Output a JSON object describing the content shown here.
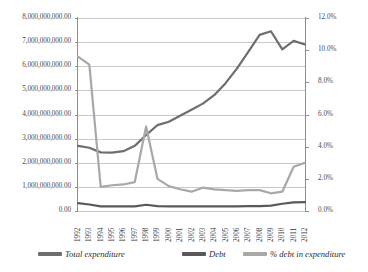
{
  "chart_data": {
    "type": "line",
    "title": "",
    "xlabel": "",
    "ylabel": "",
    "grid": true,
    "legend_position": "bottom",
    "categories": [
      "1992",
      "1993",
      "1994",
      "1995",
      "1996",
      "1997",
      "1998",
      "1999",
      "2000",
      "2001",
      "2002",
      "2003",
      "2004",
      "2005",
      "2006",
      "2007",
      "2008",
      "2009",
      "2010",
      "2011",
      "2012"
    ],
    "left_axis": {
      "ylim": [
        0,
        8000000000
      ],
      "tick_labels": [
        "8,000,000,000.00",
        "7,000,000,000.00",
        "6,000,000,000.00",
        "5,000,000,000.00",
        "4,000,000,000.00",
        "3,000,000,000.00",
        "2,000,000,000.00",
        "1,000,000,000.00",
        "0.00"
      ],
      "tick_values": [
        8000000000,
        7000000000,
        6000000000,
        5000000000,
        4000000000,
        3000000000,
        2000000000,
        1000000000,
        0
      ]
    },
    "right_axis": {
      "ylim": [
        0,
        12
      ],
      "tick_labels": [
        "12.0%",
        "10.0%",
        "8.0%",
        "6.0%",
        "4.0%",
        "2.0%",
        "0.0%"
      ],
      "tick_values": [
        12,
        10,
        8,
        6,
        4,
        2,
        0
      ]
    },
    "series": [
      {
        "name": "Total expenditure",
        "axis": "left",
        "color": "#6e6e6e",
        "values": [
          2700000000,
          2620000000,
          2430000000,
          2420000000,
          2480000000,
          2700000000,
          3150000000,
          3560000000,
          3700000000,
          3950000000,
          4200000000,
          4450000000,
          4800000000,
          5300000000,
          5900000000,
          6600000000,
          7300000000,
          7450000000,
          6700000000,
          7050000000,
          6900000000
        ]
      },
      {
        "name": "Debt",
        "axis": "left",
        "color": "#595959",
        "values": [
          330000000,
          270000000,
          195000000,
          190000000,
          190000000,
          195000000,
          260000000,
          200000000,
          195000000,
          195000000,
          195000000,
          195000000,
          195000000,
          195000000,
          195000000,
          200000000,
          205000000,
          225000000,
          300000000,
          360000000,
          370000000
        ]
      },
      {
        "name": "% debt in expenditure",
        "axis": "right",
        "color": "#a8a8a8",
        "values": [
          9.6,
          9.1,
          1.5,
          1.6,
          1.65,
          1.8,
          5.25,
          2.0,
          1.55,
          1.35,
          1.2,
          1.45,
          1.35,
          1.3,
          1.25,
          1.3,
          1.3,
          1.1,
          1.2,
          2.75,
          3.0
        ]
      }
    ]
  },
  "legend": {
    "items": [
      {
        "label": "Total expenditure",
        "color": "#6e6e6e"
      },
      {
        "label": "Debt",
        "color": "#595959"
      },
      {
        "label": "% debt in expenditure",
        "color": "#a8a8a8"
      }
    ]
  }
}
